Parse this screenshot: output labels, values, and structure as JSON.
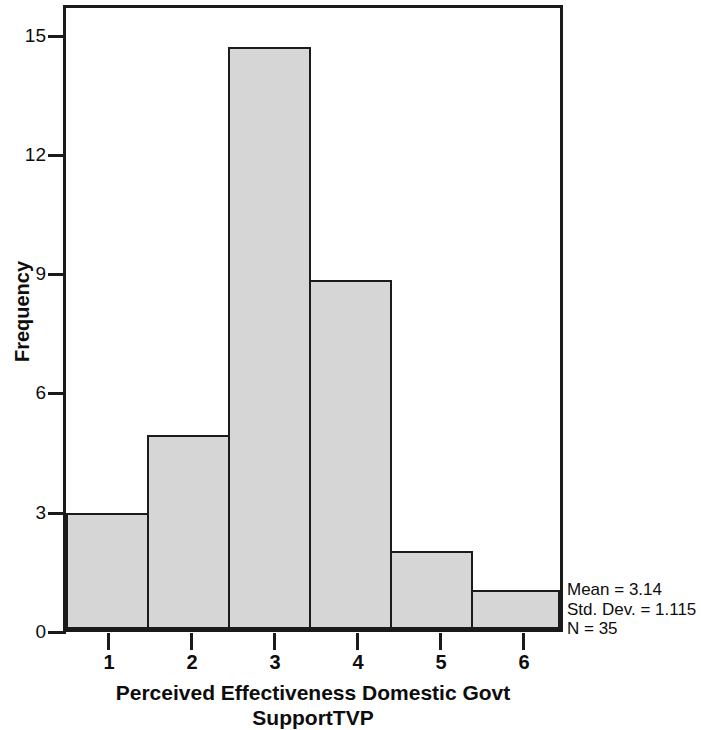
{
  "chart_data": {
    "type": "bar",
    "title": "",
    "subtitle": "",
    "xlabel_line1": "Perceived Effectiveness Domestic Govt",
    "xlabel_line2": "SupportTVP",
    "ylabel": "Frequency",
    "categories": [
      "1",
      "2",
      "3",
      "4",
      "5",
      "6"
    ],
    "values": [
      3,
      5,
      15,
      9,
      2,
      1
    ],
    "ylim": [
      0,
      16
    ],
    "ytick_labels": [
      "0",
      "3",
      "6",
      "9",
      "12",
      "15"
    ],
    "ytick_values": [
      0,
      3,
      6,
      9,
      12,
      15
    ],
    "grid": false,
    "legend": "none",
    "bar_fill_color": "#d6d6d6",
    "bar_border_color": "#1b1b1b",
    "axis_color": "#1a1a1a",
    "text_color": "#0d0d0d"
  },
  "annotations": {
    "mean": "Mean = 3.14",
    "std_dev": "Std. Dev. = 1.115",
    "n": "N = 35"
  }
}
